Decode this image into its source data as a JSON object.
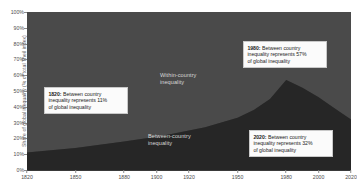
{
  "chart_data": {
    "type": "area",
    "stacked": true,
    "title": "",
    "xlabel": "",
    "ylabel": "Share of global inequality (% of total Theil index)",
    "xlim": [
      1820,
      2020
    ],
    "ylim": [
      0,
      100
    ],
    "grid": false,
    "legend_position": "inline-labels",
    "x_ticks": [
      1820,
      1850,
      1880,
      1900,
      1920,
      1950,
      1980,
      2000,
      2020
    ],
    "x_tick_labels": [
      "1820",
      "1850",
      "1880",
      "1900",
      "1920",
      "1950",
      "1980",
      "2000",
      "2020"
    ],
    "y_ticks": [
      0,
      10,
      20,
      30,
      40,
      50,
      60,
      70,
      80,
      90,
      100
    ],
    "y_tick_labels": [
      "0%",
      "10%",
      "20%",
      "30%",
      "40%",
      "50%",
      "60%",
      "70%",
      "80%",
      "90%",
      "100%"
    ],
    "x": [
      1820,
      1850,
      1880,
      1900,
      1910,
      1920,
      1930,
      1940,
      1950,
      1960,
      1970,
      1980,
      1990,
      2000,
      2010,
      2020
    ],
    "series": [
      {
        "name": "Between-country inequality",
        "color": "#262626",
        "values": [
          11,
          14,
          18,
          21,
          23,
          25,
          27,
          30,
          33,
          38,
          45,
          57,
          52,
          46,
          39,
          32
        ]
      },
      {
        "name": "Within-country inequality",
        "color": "#4a4a4a",
        "values": [
          89,
          86,
          82,
          79,
          77,
          75,
          73,
          70,
          67,
          62,
          55,
          43,
          48,
          54,
          61,
          68
        ]
      }
    ],
    "annotations": [
      {
        "id": "annotation-1820",
        "year": 1820,
        "value": 11,
        "text": "1820: Between country inequality represents 11% of global inequality",
        "bold_prefix": "1820:",
        "rest": " Between country\ninequality represents 11%\nof global inequality"
      },
      {
        "id": "annotation-1980",
        "year": 1980,
        "value": 57,
        "text": "1980: Between country inequality represents 57% of global inequality",
        "bold_prefix": "1980:",
        "rest": " Between country\ninequality represents 57%\nof global inequality"
      },
      {
        "id": "annotation-2020",
        "year": 2020,
        "value": 32,
        "text": "2020: Between country inequality represents 32% of global inequality",
        "bold_prefix": "2020:",
        "rest": " Between country\ninequality represents 32%\nof global inequality"
      }
    ],
    "inline_labels": [
      {
        "id": "within-country-label",
        "text": "Within-country\ninequality"
      },
      {
        "id": "between-country-label",
        "text": "Between-country\ninequality"
      }
    ]
  },
  "axes": {
    "y_title": "Share of global inequality (% of total Theil index)"
  },
  "colors": {
    "plot_background": "#3c3c3c",
    "within_country_area": "#4a4a4a",
    "between_country_area": "#262626",
    "page_background": "#ffffff",
    "tick_text": "#4d4d4d",
    "inline_label_text": "#d8d8d8",
    "callout_background": "#fbfbfb",
    "callout_border": "#c9c9c9",
    "callout_text": "#1a1a1a"
  }
}
